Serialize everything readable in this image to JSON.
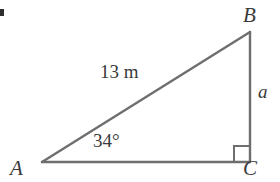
{
  "figure": {
    "type": "right-triangle-diagram",
    "stroke_color": "#6e6e6e",
    "text_color": "#3a3a3a",
    "background_color": "#ffffff",
    "vertices": {
      "A": {
        "label": "A",
        "x": 42,
        "y": 162
      },
      "B": {
        "label": "B",
        "x": 250,
        "y": 32
      },
      "C": {
        "label": "C",
        "x": 250,
        "y": 162
      }
    },
    "labels": {
      "vertex_a": "A",
      "vertex_b": "B",
      "vertex_c": "C",
      "hypotenuse": "13 m",
      "opposite_side": "a",
      "angle_at_a": "34°"
    },
    "right_angle": {
      "at_vertex": "C",
      "marker": "square",
      "size": 16
    },
    "partial_mark": {
      "name": "question-number-fragment",
      "color": "#2e2e2e"
    }
  }
}
